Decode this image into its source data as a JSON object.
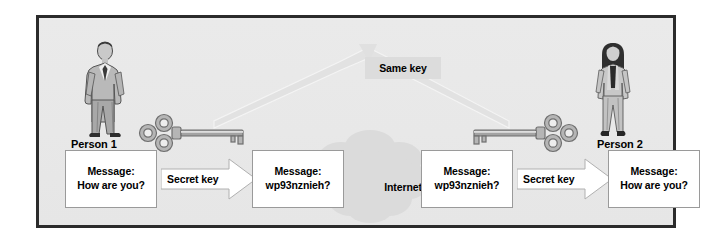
{
  "diagram": {
    "title_present": false,
    "colors": {
      "frame_border": "#2b2b2b",
      "panel_background": "#e9e9e9",
      "box_background": "#ffffff",
      "box_border": "#9a9a9a",
      "same_key_background": "#dcdcdc",
      "cloud_fill": "#dadada",
      "connector_fill": "#e0e0e0",
      "key_metal": "#8f8f8f",
      "text": "#000000"
    },
    "shared_key": {
      "label": "Same key",
      "icon": "same-key-box"
    },
    "network": {
      "label": "Internet",
      "icon": "cloud-icon"
    },
    "actors": [
      {
        "id": "person-1",
        "label": "Person 1",
        "icon": "man-in-suit-icon"
      },
      {
        "id": "person-2",
        "label": "Person 2",
        "icon": "woman-in-suit-icon"
      }
    ],
    "keys": [
      {
        "id": "key-left",
        "icon": "skeleton-key-icon",
        "orientation": "bow-left"
      },
      {
        "id": "key-right",
        "icon": "skeleton-key-icon",
        "orientation": "bow-right"
      }
    ],
    "flow": [
      {
        "id": "plaintext-out",
        "kind": "box",
        "line1": "Message:",
        "line2": "How are you?"
      },
      {
        "id": "encrypt-arrow",
        "kind": "arrow",
        "label": "Secret key",
        "direction": "right"
      },
      {
        "id": "ciphertext-out",
        "kind": "box",
        "line1": "Message:",
        "line2": "wp93nznieh?"
      },
      {
        "id": "transport",
        "kind": "cloud",
        "label": "Internet"
      },
      {
        "id": "ciphertext-in",
        "kind": "box",
        "line1": "Message:",
        "line2": "wp93nznieh?"
      },
      {
        "id": "decrypt-arrow",
        "kind": "arrow",
        "label": "Secret key",
        "direction": "right"
      },
      {
        "id": "plaintext-in",
        "kind": "box",
        "line1": "Message:",
        "line2": "How are you?"
      }
    ]
  }
}
